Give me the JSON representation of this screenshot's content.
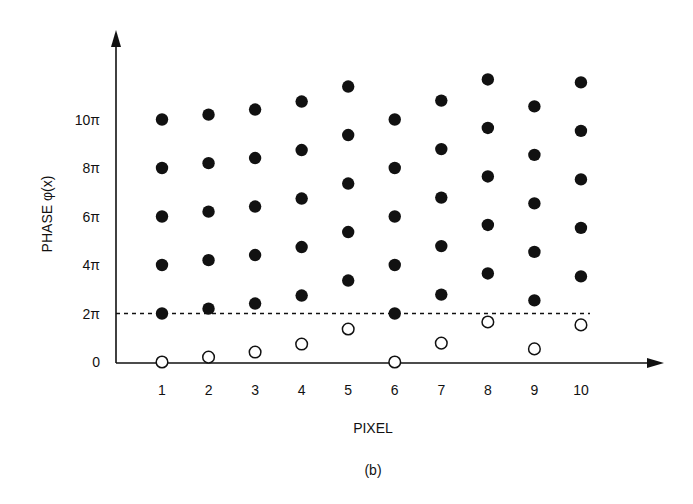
{
  "chart_data": {
    "type": "scatter",
    "title": "",
    "caption": "(b)",
    "xlabel": "PIXEL",
    "ylabel": "PHASE φ(x)",
    "x": [
      1,
      2,
      3,
      4,
      5,
      6,
      7,
      8,
      9,
      10
    ],
    "x_tick_labels": [
      "1",
      "2",
      "3",
      "4",
      "5",
      "6",
      "7",
      "8",
      "9",
      "10"
    ],
    "y_tick_labels": [
      "0",
      "2π",
      "4π",
      "6π",
      "8π",
      "10π"
    ],
    "y_ticks_in_pi": [
      0,
      2,
      4,
      6,
      8,
      10
    ],
    "y_unit": "pi",
    "ylim_in_pi": [
      0,
      13.6
    ],
    "xlim": [
      0,
      11.5
    ],
    "grid": false,
    "reference_line": {
      "y_in_pi": 2,
      "style": "dashed",
      "label": "2π"
    },
    "series": [
      {
        "name": "wrapped phase (open circles)",
        "marker": "open-circle",
        "values_in_pi": [
          0.0,
          0.2,
          0.41,
          0.74,
          1.36,
          0.0,
          0.78,
          1.65,
          0.54,
          1.53
        ]
      },
      {
        "name": "possible unwrapped phase (filled circles)",
        "marker": "filled-circle",
        "offsets_in_pi": [
          2,
          4,
          6,
          8,
          10
        ],
        "values_in_pi": [
          [
            2.0,
            4.0,
            6.0,
            8.0,
            10.0
          ],
          [
            2.2,
            4.2,
            6.2,
            8.2,
            10.2
          ],
          [
            2.41,
            4.41,
            6.41,
            8.41,
            10.41
          ],
          [
            2.74,
            4.74,
            6.74,
            8.74,
            10.74
          ],
          [
            3.36,
            5.36,
            7.36,
            9.36,
            11.36
          ],
          [
            2.0,
            4.0,
            6.0,
            8.0,
            10.0
          ],
          [
            2.78,
            4.78,
            6.78,
            8.78,
            10.78
          ],
          [
            3.65,
            5.65,
            7.65,
            9.65,
            11.65
          ],
          [
            2.54,
            4.54,
            6.54,
            8.54,
            10.54
          ],
          [
            3.53,
            5.53,
            7.53,
            9.53,
            11.53
          ]
        ]
      }
    ],
    "legend": null
  }
}
